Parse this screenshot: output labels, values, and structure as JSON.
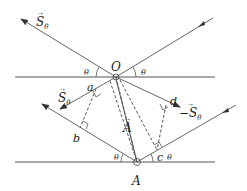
{
  "diagram": {
    "title": "",
    "points": {
      "O": {
        "label": "O",
        "x": 116,
        "y": 77
      },
      "A": {
        "label": "A",
        "x": 137,
        "y": 162
      },
      "a": {
        "label": "a"
      },
      "b": {
        "label": "b"
      },
      "c": {
        "label": "c"
      },
      "d": {
        "label": "d"
      }
    },
    "vectors": {
      "S_top": {
        "label": "S",
        "sub": "θ"
      },
      "S_mid": {
        "label": "S",
        "sub": "θ"
      },
      "S_neg": {
        "label": "−S",
        "sub": "θ"
      },
      "A_vec": {
        "label": "A"
      }
    },
    "angles": {
      "theta": "θ"
    },
    "colors": {
      "line": "#555555",
      "text": "#222222"
    }
  }
}
